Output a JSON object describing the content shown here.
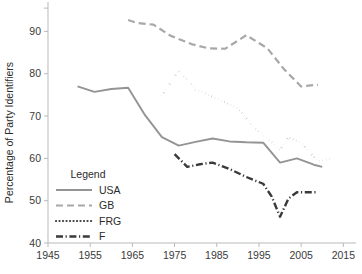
{
  "chart_data": {
    "type": "line",
    "title": "",
    "xlabel": "",
    "ylabel": "Percentage of Party Identifiers",
    "xlim": [
      1945,
      2018
    ],
    "ylim": [
      40,
      96
    ],
    "xticks": [
      1945,
      1955,
      1965,
      1975,
      1985,
      1995,
      2005,
      2015
    ],
    "xtick_labels": [
      "1945",
      "1955",
      "1965",
      "1975",
      "1985",
      "1995",
      "2005",
      "2015"
    ],
    "yticks": [
      40,
      50,
      60,
      70,
      80,
      90
    ],
    "ytick_labels": [
      "40",
      "50",
      "60",
      "70",
      "80",
      "90"
    ],
    "grid": false,
    "legend_position": "inside-lower-left",
    "legend_title": "Legend",
    "series": [
      {
        "name": "USA",
        "color": "#949494",
        "style": "solid",
        "width": 1.9,
        "points": [
          [
            1952,
            77.0
          ],
          [
            1956,
            75.7
          ],
          [
            1960,
            76.4
          ],
          [
            1964,
            76.7
          ],
          [
            1968,
            70.2
          ],
          [
            1972,
            65.0
          ],
          [
            1976,
            63.0
          ],
          [
            1980,
            63.9
          ],
          [
            1984,
            64.7
          ],
          [
            1988,
            64.0
          ],
          [
            1992,
            63.8
          ],
          [
            1996,
            63.7
          ],
          [
            2000,
            59.0
          ],
          [
            2004,
            60.0
          ],
          [
            2008,
            58.5
          ],
          [
            2010,
            58.0
          ]
        ]
      },
      {
        "name": "GB",
        "color": "#a8a8a8",
        "style": "dashed",
        "width": 2.2,
        "points": [
          [
            1964,
            92.7
          ],
          [
            1966,
            92.0
          ],
          [
            1970,
            91.6
          ],
          [
            1974,
            89.0
          ],
          [
            1979,
            87.0
          ],
          [
            1983,
            86.0
          ],
          [
            1987,
            85.9
          ],
          [
            1992,
            89.1
          ],
          [
            1997,
            86.0
          ],
          [
            2001,
            81.0
          ],
          [
            2005,
            77.0
          ],
          [
            2009,
            77.4
          ]
        ]
      },
      {
        "name": "FRG",
        "color": "#3d3d3d",
        "style": "dotted",
        "width": 2.2,
        "points": [
          [
            1972,
            74.8
          ],
          [
            1976,
            80.8
          ],
          [
            1980,
            76.2
          ],
          [
            1983,
            75.0
          ],
          [
            1987,
            73.2
          ],
          [
            1990,
            71.8
          ],
          [
            1994,
            67.2
          ],
          [
            1998,
            63.8
          ],
          [
            2000,
            62.0
          ],
          [
            2002,
            65.0
          ],
          [
            2005,
            63.6
          ],
          [
            2009,
            59.3
          ],
          [
            2012,
            60.0
          ]
        ]
      },
      {
        "name": "F",
        "color": "#3a3a3a",
        "style": "dashdot",
        "width": 2.4,
        "points": [
          [
            1975,
            61.0
          ],
          [
            1978,
            58.0
          ],
          [
            1981,
            58.6
          ],
          [
            1984,
            59.0
          ],
          [
            1988,
            57.5
          ],
          [
            1992,
            55.6
          ],
          [
            1996,
            54.0
          ],
          [
            1998,
            51.0
          ],
          [
            2000,
            46.2
          ],
          [
            2002,
            50.5
          ],
          [
            2004,
            52.0
          ],
          [
            2007,
            52.0
          ],
          [
            2009,
            52.0
          ]
        ]
      }
    ]
  },
  "legend": {
    "title": "Legend",
    "entries": [
      {
        "label": "USA"
      },
      {
        "label": "GB"
      },
      {
        "label": "FRG"
      },
      {
        "label": "F"
      }
    ]
  },
  "axes": {
    "y_title": "Percentage of Party Identifiers"
  }
}
